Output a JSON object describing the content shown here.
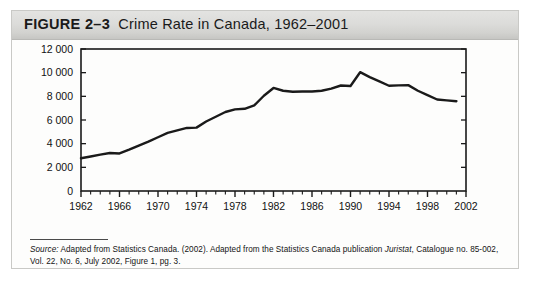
{
  "figure": {
    "number_label": "FIGURE 2–3",
    "caption": "Crime Rate in Canada, 1962–2001",
    "full_title": "FIGURE 2–3  Crime Rate in Canada, 1962–2001"
  },
  "source_note": {
    "label": "Source:",
    "body_part1": " Adapted from Statistics Canada. (2002). Adapted from the Statistics Canada publication ",
    "italic_title": "Juristat",
    "body_part2": ", Catalogue no. 85-002, Vol. 22, No. 6, July 2002, Figure 1, pg. 3.",
    "full_text": "Source: Adapted from Statistics Canada. (2002). Adapted from the Statistics Canada publication Juristat, Catalogue no. 85-002, Vol. 22, No. 6, July 2002, Figure 1, pg. 3."
  },
  "chart_data": {
    "type": "line",
    "title": "Crime Rate in Canada, 1962–2001",
    "xlabel": "",
    "ylabel": "",
    "xlim": [
      1962,
      2002
    ],
    "ylim": [
      0,
      12000
    ],
    "grid": false,
    "legend_position": "none",
    "y_ticks": [
      0,
      2000,
      4000,
      6000,
      8000,
      10000,
      12000
    ],
    "y_tick_labels": [
      "0",
      "2 000",
      "4 000",
      "6 000",
      "8 000",
      "10 000",
      "12 000"
    ],
    "x_ticks": [
      1962,
      1966,
      1970,
      1974,
      1978,
      1982,
      1986,
      1990,
      1994,
      1998,
      2002
    ],
    "x_tick_labels": [
      "1962",
      "1966",
      "1970",
      "1974",
      "1978",
      "1982",
      "1986",
      "1990",
      "1994",
      "1998",
      "2002"
    ],
    "x_minor_tick_interval": 1,
    "line_color": "#1a1a1a",
    "line_width": 2.4,
    "x": [
      1962,
      1963,
      1964,
      1965,
      1966,
      1967,
      1968,
      1969,
      1970,
      1971,
      1972,
      1973,
      1974,
      1975,
      1976,
      1977,
      1978,
      1979,
      1980,
      1981,
      1982,
      1983,
      1984,
      1985,
      1986,
      1987,
      1988,
      1989,
      1990,
      1991,
      1992,
      1993,
      1994,
      1995,
      1996,
      1997,
      1998,
      1999,
      2000,
      2001
    ],
    "values": [
      2771,
      2913,
      3069,
      3212,
      3170,
      3492,
      3841,
      4165,
      4541,
      4909,
      5126,
      5328,
      5355,
      5876,
      6274,
      6677,
      6900,
      6950,
      7238,
      8049,
      8707,
      8470,
      8387,
      8406,
      8410,
      8472,
      8653,
      8916,
      8872,
      10040,
      9620,
      9265,
      8897,
      8930,
      8946,
      8472,
      8100,
      7730,
      7655,
      7590
    ],
    "annotations": []
  }
}
